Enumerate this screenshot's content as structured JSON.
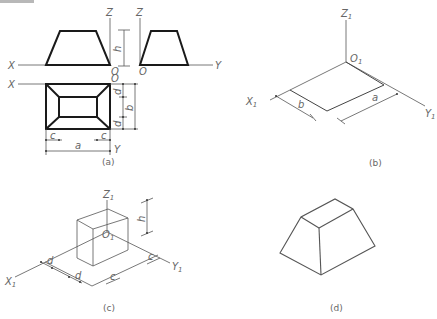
{
  "figure": {
    "panels": [
      {
        "id": "a",
        "caption": "(a)",
        "description": "Three-view orthographic projection of a frustum (truncated pyramid)",
        "axis_labels": {
          "x_front": "X",
          "z_front": "Z",
          "z_side": "Z",
          "y_side": "Y",
          "x_top": "X",
          "y_top": "Y",
          "origin_front": "O",
          "origin_side": "O",
          "origin_top": "O"
        },
        "dimensions": {
          "height": "h",
          "width": "a",
          "depth": "b",
          "inset_x_left": "c",
          "inset_x_right": "c",
          "inset_y_top": "d",
          "inset_y_bottom": "d"
        }
      },
      {
        "id": "b",
        "caption": "(b)",
        "description": "Isometric axes with base rectangle a × b",
        "axis_labels": {
          "z": "Z",
          "x": "X",
          "y": "Y",
          "origin": "O",
          "subscript": "1"
        },
        "dimensions": {
          "depth": "b",
          "width": "a"
        }
      },
      {
        "id": "c",
        "caption": "(c)",
        "description": "Isometric construction of top face offset by c and d at height h",
        "axis_labels": {
          "z": "Z",
          "x": "X",
          "y": "Y",
          "origin": "O",
          "subscript": "1"
        },
        "dimensions": {
          "height": "h",
          "inset_d1": "d",
          "inset_d2": "d",
          "inset_c1": "c",
          "inset_c2": "c"
        }
      },
      {
        "id": "d",
        "caption": "(d)",
        "description": "Finished isometric drawing of frustum"
      }
    ]
  }
}
